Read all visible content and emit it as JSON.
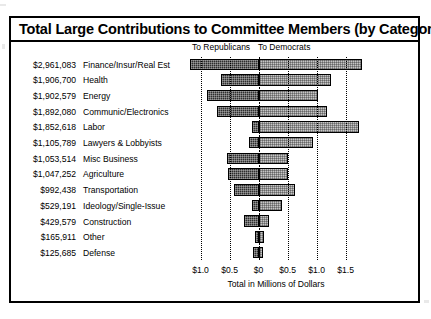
{
  "title": "Total Large Contributions to Committee Members (by Category)",
  "headings": {
    "republicans": "To Republicans",
    "democrats": "To Democrats"
  },
  "colors": {
    "republican_bar": "#2e2e2e",
    "democrat_bar": "#c6c6c6",
    "frame": "#000000",
    "background": "#ffffff"
  },
  "chart_data": {
    "type": "bar",
    "orientation": "horizontal",
    "layout": "diverging",
    "title": "Total Large Contributions to Committee Members (by Category)",
    "xlabel": "Total in Millions of Dollars",
    "ylabel": "",
    "grid": true,
    "legend_position": "top",
    "xlim": [
      -1.25,
      1.85
    ],
    "xticks": [
      -1.0,
      -0.5,
      0,
      0.5,
      1.0,
      1.5
    ],
    "xticklabels": [
      "$1.0",
      "$0.5",
      "$0",
      "$0.5",
      "$1.0",
      "$1.5"
    ],
    "categories": [
      "Finance/Insur/Real Est",
      "Health",
      "Energy",
      "Communic/Electronics",
      "Labor",
      "Lawyers & Lobbyists",
      "Misc Business",
      "Agriculture",
      "Transportation",
      "Ideology/Single-Issue",
      "Construction",
      "Other",
      "Defense"
    ],
    "totals_labels": [
      "$2,961,083",
      "$1,906,700",
      "$1,902,579",
      "$1,892,080",
      "$1,852,618",
      "$1,105,789",
      "$1,053,514",
      "$1,047,252",
      "$992,438",
      "$529,191",
      "$429,579",
      "$165,911",
      "$125,685"
    ],
    "totals": [
      2961083,
      1906700,
      1902579,
      1892080,
      1852618,
      1105789,
      1053514,
      1047252,
      992438,
      529191,
      429579,
      165911,
      125685
    ],
    "series": [
      {
        "name": "To Republicans",
        "direction": "left",
        "values": [
          -1.18,
          -0.64,
          -0.88,
          -0.72,
          -0.12,
          -0.17,
          -0.55,
          -0.53,
          -0.42,
          -0.12,
          -0.25,
          -0.07,
          -0.09
        ]
      },
      {
        "name": "To Democrats",
        "direction": "right",
        "values": [
          1.78,
          1.25,
          1.02,
          1.18,
          1.73,
          0.93,
          0.51,
          0.5,
          0.62,
          0.4,
          0.18,
          0.1,
          0.07
        ]
      }
    ]
  }
}
